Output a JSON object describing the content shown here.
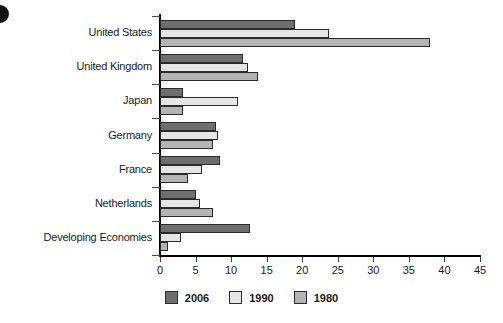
{
  "chart_data": {
    "type": "bar",
    "orientation": "horizontal",
    "title": "",
    "xlabel": "",
    "ylabel": "",
    "xlim": [
      0,
      45
    ],
    "xticks": [
      0,
      5,
      10,
      15,
      20,
      25,
      30,
      35,
      40,
      45
    ],
    "grid": false,
    "legend_position": "bottom-center",
    "categories": [
      "United States",
      "United Kingdom",
      "Japan",
      "Germany",
      "France",
      "Netherlands",
      "Developing Economies"
    ],
    "series": [
      {
        "name": "2006",
        "color": "#6e6e6e",
        "values": [
          19.0,
          11.7,
          3.3,
          7.9,
          8.4,
          5.1,
          12.7
        ]
      },
      {
        "name": "1990",
        "color": "#e6e6e6",
        "values": [
          23.7,
          12.4,
          11.0,
          8.2,
          5.9,
          5.6,
          2.9
        ]
      },
      {
        "name": "1980",
        "color": "#b4b4b4",
        "values": [
          38.0,
          13.8,
          3.3,
          7.4,
          3.9,
          7.4,
          1.1
        ]
      }
    ]
  }
}
